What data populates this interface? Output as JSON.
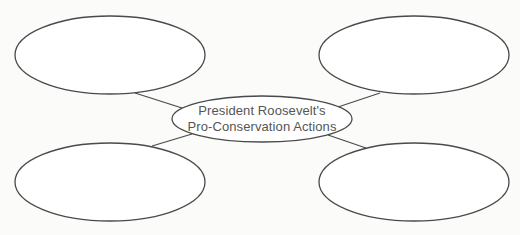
{
  "diagram": {
    "type": "concept-web",
    "center": {
      "line1": "President Roosevelt's",
      "line2": "Pro-Conservation Actions"
    },
    "branches": [
      {
        "position": "top-left",
        "text": ""
      },
      {
        "position": "top-right",
        "text": ""
      },
      {
        "position": "bottom-left",
        "text": ""
      },
      {
        "position": "bottom-right",
        "text": ""
      }
    ],
    "colors": {
      "stroke": "#4a4a4a",
      "text": "#555555",
      "background": "#fbfbfa",
      "fill": "#ffffff"
    }
  }
}
